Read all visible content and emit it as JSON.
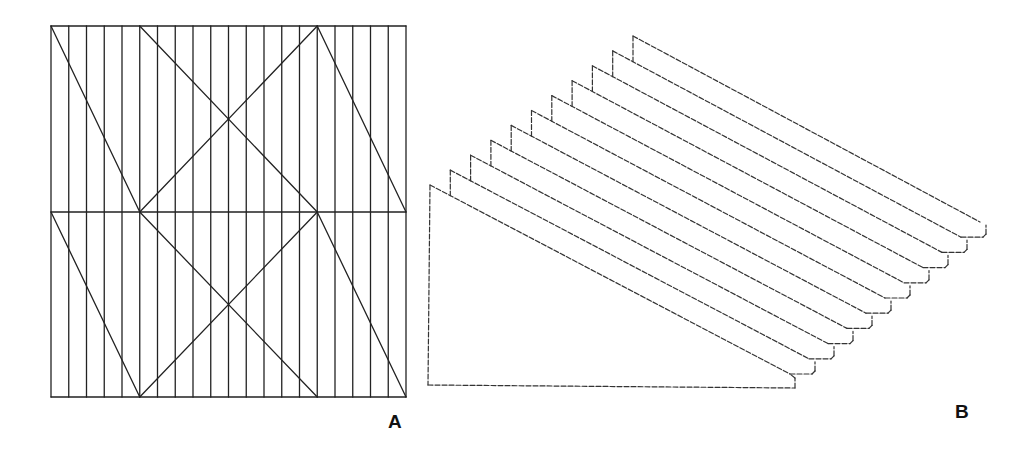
{
  "figure_a": {
    "label": "A",
    "frame": {
      "x0": 51,
      "x1": 406,
      "y_top": 26,
      "y_mid": 212,
      "y_bottom": 397
    },
    "vertical_line_count": 21,
    "diagonal_anchor_columns": {
      "left": 0,
      "inner_left": 5,
      "inner_right": 15,
      "right": 20
    },
    "stroke_color": "#222222",
    "stroke_width": 1.3
  },
  "figure_b": {
    "label": "B",
    "sheet_count": 11,
    "base": {
      "left_x": 428,
      "bottom_y": 385,
      "right_x": 795,
      "right_bottom_y": 388
    },
    "sheet_origin": {
      "x": 430,
      "y": 185
    },
    "sheet_step": {
      "dx": 20.3,
      "dy": -14.9
    },
    "diag_end_origin": {
      "x": 790,
      "y": 374
    },
    "diag_end_step": {
      "dx": 19,
      "dy": -15.2
    },
    "right_step_offset": 25,
    "stroke_color": "#333333",
    "stroke_width": 1.2,
    "dash": "5 2"
  }
}
